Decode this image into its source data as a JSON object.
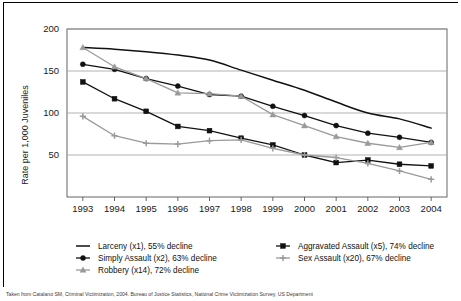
{
  "chart_data": {
    "type": "line",
    "title": "",
    "xlabel": "",
    "ylabel": "Rate per 1,000 Juveniles",
    "categories": [
      "1993",
      "1994",
      "1995",
      "1996",
      "1997",
      "1998",
      "1999",
      "2000",
      "2001",
      "2002",
      "2003",
      "2004"
    ],
    "ylim": [
      0,
      200
    ],
    "yticks": [
      50,
      100,
      150,
      200
    ],
    "grid": true,
    "legend_position": "below",
    "series": [
      {
        "name": "Larceny (x1), 55% decline",
        "label": "Larceny (x1), 55% decline",
        "marker": "none",
        "color": "#111111",
        "values": [
          178,
          176,
          173,
          169,
          163,
          151,
          139,
          127,
          113,
          100,
          93,
          82
        ]
      },
      {
        "name": "Simply Assault (x2), 63% decline",
        "label": "Simply Assault (x2), 63% decline",
        "marker": "circle",
        "color": "#111111",
        "values": [
          158,
          152,
          141,
          132,
          122,
          120,
          108,
          97,
          85,
          76,
          71,
          65
        ]
      },
      {
        "name": "Robbery (x14), 72% decline",
        "label": "Robbery (x14), 72% decline",
        "marker": "triangle",
        "color": "#9a9a9a",
        "values": [
          178,
          155,
          141,
          124,
          123,
          120,
          98,
          85,
          72,
          64,
          59,
          65
        ]
      },
      {
        "name": "Aggravated Assault (x5), 74% decline",
        "label": "Aggravated Assault (x5), 74% decline",
        "marker": "square",
        "color": "#111111",
        "values": [
          137,
          117,
          102,
          84,
          79,
          70,
          62,
          50,
          41,
          44,
          39,
          37
        ]
      },
      {
        "name": "Sex Assault (x20), 67% decline",
        "label": "Sex Assault (x20), 67% decline",
        "marker": "plus",
        "color": "#9a9a9a",
        "values": [
          96,
          73,
          64,
          63,
          67,
          68,
          58,
          50,
          47,
          40,
          31,
          21
        ]
      }
    ]
  },
  "legend": {
    "column_left": [
      "Larceny (x1), 55% decline",
      "Simply Assault (x2), 63% decline",
      "Robbery (x14), 72% decline"
    ],
    "column_right": [
      "Aggravated Assault (x5), 74% decline",
      "Sex Assault (x20), 67% decline"
    ]
  },
  "caption": {
    "text": "Taken from Catalano SM, Criminal Victimization, 2004. Bureau of Justice Statistics, National Crime Victimization Survey, US Department"
  }
}
